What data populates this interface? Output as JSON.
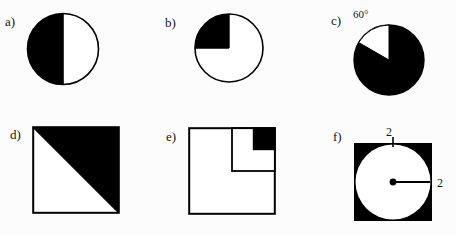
{
  "sheet": {
    "title": "Shaded region geometry figures",
    "background_color": "#fcfcfc",
    "ink_color": "#000000",
    "figure_count": 6
  },
  "figures": [
    {
      "id": "a",
      "label": "a)",
      "shape": "circle",
      "description": "Circle with left half shaded black",
      "shaded_fraction": "1/2",
      "annotations": []
    },
    {
      "id": "b",
      "label": "b)",
      "shape": "circle",
      "description": "Circle with upper-left quarter shaded black",
      "shaded_fraction": "1/4",
      "annotations": []
    },
    {
      "id": "c",
      "label": "c)",
      "shape": "circle",
      "description": "Circle fully shaded black except a white 60 degree sector at the top",
      "shaded_fraction": "5/6",
      "annotations": [
        {
          "name": "sector-angle",
          "text": "60°"
        }
      ]
    },
    {
      "id": "d",
      "label": "d)",
      "shape": "square",
      "description": "Square with the upper-right triangular half shaded black",
      "shaded_fraction": "1/2",
      "annotations": []
    },
    {
      "id": "e",
      "label": "e)",
      "shape": "square",
      "description": "Square containing a half-size inner square in the upper right, whose upper-right quarter is shaded black",
      "shaded_fraction": "1/16",
      "annotations": []
    },
    {
      "id": "f",
      "label": "f)",
      "shape": "square-with-inscribed-circle",
      "description": "Black square with an inscribed white circle, center dot and radius segment drawn to the right",
      "annotations": [
        {
          "name": "top-side-dimension",
          "text": "2"
        },
        {
          "name": "radius-dimension",
          "text": "2"
        }
      ]
    }
  ],
  "labels": {
    "a": "a)",
    "b": "b)",
    "c": "c)",
    "d": "d)",
    "e": "e)",
    "f": "f)"
  },
  "annotations": {
    "c_angle": "60°",
    "f_top": "2",
    "f_right": "2"
  }
}
